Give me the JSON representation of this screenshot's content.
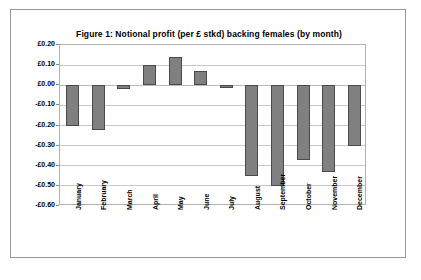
{
  "chart_data": {
    "type": "bar",
    "title": "Figure 1: Notional profit (per £ stkd) backing females (by month)",
    "xlabel": "",
    "ylabel": "",
    "categories": [
      "January",
      "February",
      "March",
      "April",
      "May",
      "June",
      "July",
      "August",
      "September",
      "October",
      "November",
      "December"
    ],
    "values": [
      -0.2,
      -0.22,
      -0.02,
      0.1,
      0.14,
      0.07,
      -0.01,
      -0.45,
      -0.5,
      -0.37,
      -0.43,
      -0.3
    ],
    "series": [
      {
        "name": "Notional profit per £ staked",
        "values": [
          -0.2,
          -0.22,
          -0.02,
          0.1,
          0.14,
          0.07,
          -0.01,
          -0.45,
          -0.5,
          -0.37,
          -0.43,
          -0.3
        ]
      }
    ],
    "ylim": [
      -0.6,
      0.2
    ],
    "ytick_values": [
      0.2,
      0.1,
      0.0,
      -0.1,
      -0.2,
      -0.3,
      -0.4,
      -0.5,
      -0.6
    ],
    "ytick_labels": [
      "£0.20",
      "£0.10",
      "£0.00",
      "-£0.10",
      "-£0.20",
      "-£0.30",
      "-£0.40",
      "-£0.50",
      "-£0.60"
    ],
    "grid": true,
    "legend": false,
    "legend_position": "none",
    "bar_color": "#808080",
    "bar_border_color": "#4a4a4a",
    "gridline_color": "#c8c8c8",
    "plot_border_color": "#b0b0b0",
    "figure_border_color": "#9a9a9a",
    "background_color": "#ffffff",
    "text_color": "#000000",
    "xlabel_rotation": -90
  }
}
